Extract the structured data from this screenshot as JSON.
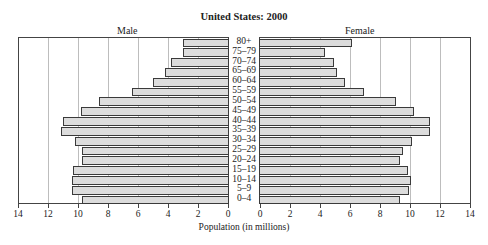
{
  "chart_data": {
    "type": "bar",
    "orientation": "horizontal",
    "subtype": "population-pyramid",
    "title": "United States: 2000",
    "xlabel": "Population (in millions)",
    "ylabel": "",
    "categories": [
      "80+",
      "75–79",
      "70–74",
      "65–69",
      "60–64",
      "55–59",
      "50–54",
      "45–49",
      "40–44",
      "35–39",
      "30–34",
      "25–29",
      "20–24",
      "15–19",
      "10–14",
      "5–9",
      "0–4"
    ],
    "series": [
      {
        "name": "Male",
        "values": [
          3.1,
          3.1,
          3.9,
          4.3,
          5.1,
          6.5,
          8.7,
          9.9,
          11.1,
          11.2,
          10.3,
          9.8,
          9.8,
          10.4,
          10.5,
          10.5,
          9.8
        ]
      },
      {
        "name": "Female",
        "values": [
          6.2,
          4.4,
          5.0,
          5.2,
          5.7,
          7.0,
          9.1,
          10.3,
          11.4,
          11.4,
          10.2,
          9.6,
          9.4,
          9.9,
          10.1,
          10.0,
          9.4
        ]
      }
    ],
    "xlim": [
      0,
      14
    ],
    "xticks": [
      0,
      2,
      4,
      6,
      8,
      10,
      12,
      14
    ],
    "male_axis_ticks": [
      "14",
      "12",
      "10",
      "8",
      "6",
      "4",
      "2",
      "0"
    ],
    "female_axis_ticks": [
      "0",
      "2",
      "4",
      "6",
      "8",
      "10",
      "12",
      "14"
    ],
    "grid": true,
    "legend": "panel labels above each side"
  },
  "labels": {
    "title": "United States: 2000",
    "male": "Male",
    "female": "Female",
    "xlabel": "Population (in millions)"
  },
  "colors": {
    "bar_fill": "#dcdcdc",
    "bar_stroke": "#3a3a3a",
    "grid": "#bdbdbd"
  }
}
